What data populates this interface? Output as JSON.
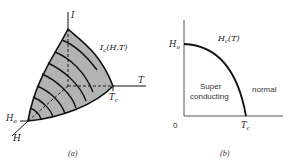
{
  "figure_a": {
    "caption": "(a)",
    "axis_i_label": "I",
    "axis_t_label": "T",
    "axis_h_label": "H",
    "surface_label": "I",
    "surface_label_sub": "c",
    "surface_label_args": "(H,T)",
    "ho_label": "H",
    "ho_sub": "o",
    "tc_label": "T",
    "tc_sub": "c",
    "surface_fill": "#b3b3b3"
  },
  "figure_b": {
    "caption": "(b)",
    "origin_label": "0",
    "ho_label": "H",
    "ho_sub": "o",
    "tc_label": "T",
    "tc_sub": "c",
    "curve_label": "H",
    "curve_label_sub": "c",
    "curve_label_args": "(T)",
    "region_super_line1": "Super",
    "region_super_line2": "conducting",
    "region_normal": "normal"
  }
}
